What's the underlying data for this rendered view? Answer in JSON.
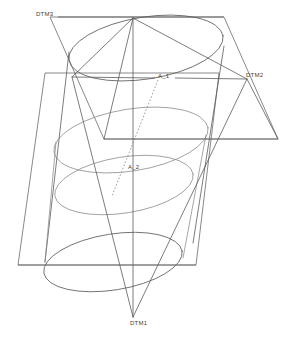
{
  "drawing": {
    "title": "Cylinder with datum planes and datum axes",
    "type": "wireframe-3d-technical-drawing",
    "width": 291,
    "height": 346,
    "background_color": "#ffffff",
    "line_color": "#5a5a5a",
    "soft_line_color": "#8a8a8a",
    "hidden_line_color": "#7d7d7d",
    "label_color": "#3d3d3d"
  },
  "labels": {
    "dtm3": "DTM3",
    "dtm2": "DTM2",
    "dtm1": "DTM1",
    "axis_1": "A_1",
    "axis_2": "A_2"
  },
  "label_positions": {
    "dtm3": {
      "x": 36,
      "y": 16
    },
    "dtm2": {
      "x": 246,
      "y": 77
    },
    "dtm1": {
      "x": 130,
      "y": 325
    },
    "axis_1": {
      "x": 158,
      "y": 78
    },
    "axis_2": {
      "x": 128,
      "y": 169
    }
  },
  "geometry": {
    "cylinder": {
      "axis_top": {
        "x": 133,
        "y": 18
      },
      "axis_bottom": {
        "x": 118,
        "y": 300
      },
      "ellipse_rx": 78,
      "ellipse_ry": 30,
      "rotation_deg": -10
    },
    "plane_dtm3": {
      "note": "upper inclined parallelogram plane",
      "corners": [
        {
          "x": 50,
          "y": 17
        },
        {
          "x": 224,
          "y": 17
        },
        {
          "x": 278,
          "y": 139
        },
        {
          "x": 104,
          "y": 139
        }
      ]
    },
    "plane_dtm1": {
      "note": "lower inclined parallelogram plane",
      "corners": [
        {
          "x": 45,
          "y": 73
        },
        {
          "x": 219,
          "y": 73
        },
        {
          "x": 196,
          "y": 265
        },
        {
          "x": 18,
          "y": 265
        }
      ]
    },
    "triangle_dtm1": {
      "note": "triangular datum converging to DTM1 apex",
      "apex": {
        "x": 133,
        "y": 317
      },
      "top_left": {
        "x": 133,
        "y": 18
      },
      "top_right": {
        "x": 247,
        "y": 79
      }
    },
    "datum_axis_A1": {
      "from": {
        "x": 72,
        "y": 77
      },
      "to": {
        "x": 247,
        "y": 79
      }
    },
    "datum_axis_A2_dashed": {
      "from": {
        "x": 158,
        "y": 80
      },
      "to": {
        "x": 112,
        "y": 196
      }
    }
  }
}
